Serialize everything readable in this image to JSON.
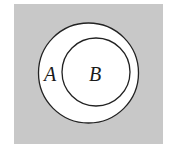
{
  "diagram": {
    "type": "venn-subset",
    "colors": {
      "universe_fill": "#c8c8c8",
      "set_fill": "#ffffff",
      "stroke": "#222222"
    },
    "sets": [
      {
        "name": "outer-set",
        "label": "A"
      },
      {
        "name": "inner-set",
        "label": "B"
      }
    ]
  }
}
